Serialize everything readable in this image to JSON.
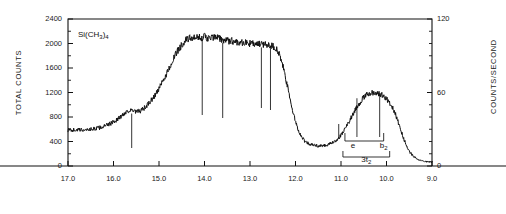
{
  "figure": {
    "sample_label": "Si(CH3)4",
    "sample_label_parts": {
      "prefix": "Si(CH",
      "sub1": "3",
      "mid": ")",
      "sub2": "4"
    }
  },
  "axes": {
    "left": {
      "title": "TOTAL COUNTS",
      "ticks": [
        0,
        400,
        800,
        1200,
        1600,
        2000,
        2400
      ],
      "min": 0,
      "max": 2400
    },
    "right": {
      "title": "COUNTS/SECOND",
      "ticks": [
        0,
        60,
        120
      ],
      "minor_ticks": [
        10,
        20,
        30,
        40,
        50,
        70,
        80,
        90,
        100,
        110
      ],
      "min": 0,
      "max": 120
    },
    "bottom": {
      "title": "",
      "ticks": [
        "17.0",
        "16.0",
        "15.0",
        "14.0",
        "13.0",
        "12.0",
        "11.0",
        "10.0",
        "9.0"
      ],
      "min": 9.0,
      "max": 17.0,
      "direction": "decreasing"
    }
  },
  "annotations": {
    "band_e": "e",
    "band_b2_prefix": "b",
    "band_b2_sub": "2",
    "bracket_prefix": "3t",
    "bracket_sub": "2"
  },
  "chart_data": {
    "type": "line",
    "title": "",
    "xlabel": "",
    "ylabel": "TOTAL COUNTS",
    "y2label": "COUNTS/SECOND",
    "xlim": [
      17.0,
      9.0
    ],
    "ylim": [
      0,
      2400
    ],
    "y2lim": [
      0,
      120
    ],
    "grid": false,
    "legend": "none",
    "series": [
      {
        "name": "photoelectron spectrum",
        "x": [
          17.0,
          16.9,
          16.8,
          16.7,
          16.6,
          16.5,
          16.4,
          16.3,
          16.2,
          16.1,
          16.0,
          15.9,
          15.8,
          15.7,
          15.6,
          15.5,
          15.4,
          15.3,
          15.2,
          15.1,
          15.0,
          14.9,
          14.8,
          14.7,
          14.6,
          14.5,
          14.4,
          14.3,
          14.2,
          14.1,
          14.0,
          13.9,
          13.8,
          13.7,
          13.6,
          13.5,
          13.4,
          13.3,
          13.2,
          13.1,
          13.0,
          12.9,
          12.8,
          12.7,
          12.6,
          12.5,
          12.4,
          12.3,
          12.2,
          12.1,
          12.0,
          11.9,
          11.8,
          11.7,
          11.6,
          11.5,
          11.4,
          11.3,
          11.2,
          11.1,
          11.0,
          10.9,
          10.8,
          10.7,
          10.6,
          10.5,
          10.4,
          10.3,
          10.2,
          10.1,
          10.0,
          9.9,
          9.8,
          9.7,
          9.6,
          9.5,
          9.4,
          9.3,
          9.2,
          9.1,
          9.0
        ],
        "y": [
          590,
          588,
          592,
          586,
          595,
          600,
          610,
          625,
          650,
          680,
          720,
          770,
          830,
          900,
          905,
          880,
          900,
          960,
          1040,
          1140,
          1260,
          1400,
          1560,
          1720,
          1870,
          1980,
          2060,
          2090,
          2080,
          2100,
          2110,
          2080,
          2100,
          2090,
          2060,
          2050,
          2040,
          2030,
          2020,
          2010,
          2000,
          1990,
          1985,
          1990,
          1980,
          1960,
          1900,
          1700,
          1380,
          1020,
          720,
          520,
          410,
          360,
          340,
          330,
          335,
          345,
          370,
          420,
          500,
          620,
          760,
          900,
          1020,
          1120,
          1180,
          1200,
          1190,
          1160,
          1100,
          1000,
          840,
          620,
          400,
          240,
          150,
          100,
          80,
          70,
          65
        ]
      }
    ],
    "peak_markers": [
      {
        "x": 15.6,
        "y_top": 905,
        "label": ""
      },
      {
        "x": 14.05,
        "y_top": 2110,
        "label": ""
      },
      {
        "x": 13.6,
        "y_top": 2060,
        "label": ""
      },
      {
        "x": 12.75,
        "y_top": 1985,
        "label": ""
      },
      {
        "x": 12.55,
        "y_top": 1960,
        "label": ""
      },
      {
        "x": 11.05,
        "y_top": 490,
        "label": ""
      },
      {
        "x": 10.65,
        "y_top": 1155,
        "label": "e"
      },
      {
        "x": 10.15,
        "y_top": 1195,
        "label": "b2"
      }
    ]
  }
}
